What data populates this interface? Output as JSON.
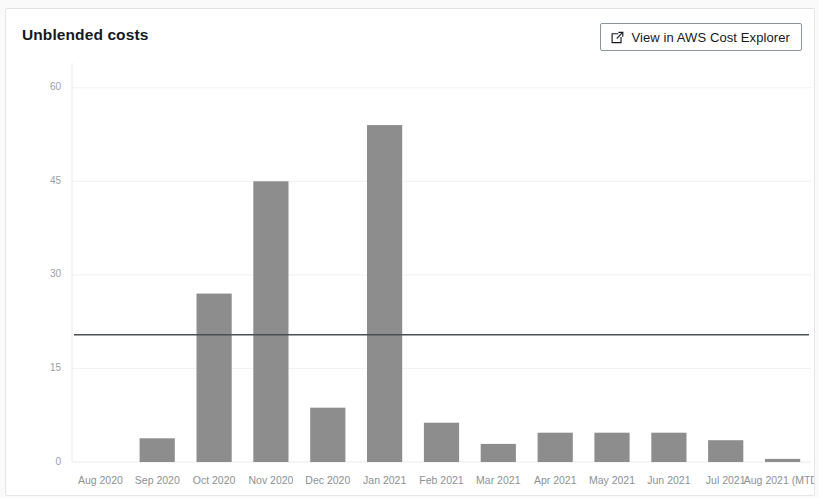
{
  "card": {
    "title": "Unblended costs",
    "button": {
      "label": "View in AWS Cost Explorer",
      "icon": "external-link-icon"
    }
  },
  "colors": {
    "bar": "#8d8d8d",
    "reference_line": "#4a4f54",
    "title_text": "#16191f",
    "tick_text": "#8b9196",
    "card_border": "#e4e6e8",
    "button_border": "#8d9499"
  },
  "chart_data": {
    "type": "bar",
    "title": "Unblended costs",
    "xlabel": "",
    "ylabel": "",
    "ylim": [
      0,
      63
    ],
    "yticks": [
      0,
      15,
      30,
      45,
      60
    ],
    "ytick_labels": [
      "0",
      "15",
      "30",
      "45",
      "60"
    ],
    "grid": true,
    "legend": null,
    "categories": [
      "Aug 2020",
      "Sep 2020",
      "Oct 2020",
      "Nov 2020",
      "Dec 2020",
      "Jan 2021",
      "Feb 2021",
      "Mar 2021",
      "Apr 2021",
      "May 2021",
      "Jun 2021",
      "Jul 2021",
      "Aug 2021 (MTD)"
    ],
    "values": [
      0,
      3.8,
      27,
      45,
      8.7,
      54,
      6.3,
      2.9,
      4.7,
      4.7,
      4.7,
      3.5,
      0.5
    ],
    "annotations": [
      {
        "type": "horizontal-reference-line",
        "value": 20.4,
        "label": ""
      }
    ]
  }
}
